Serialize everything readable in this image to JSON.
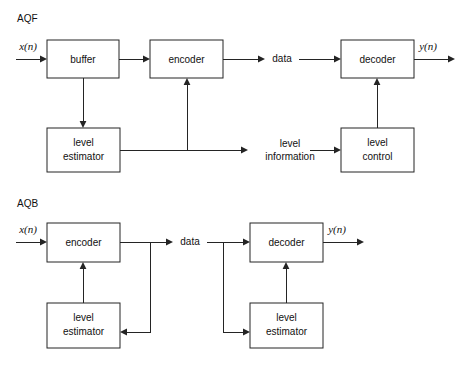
{
  "figure": {
    "width": 466,
    "height": 367,
    "background": "#ffffff",
    "line_color": "#242424",
    "text_color": "#111111"
  },
  "diagrams": [
    {
      "id": "aqf",
      "title": "AQF",
      "title_x": 17,
      "title_y": 19,
      "boxes": [
        {
          "id": "aqf-buffer",
          "label": "buffer",
          "x": 47,
          "y": 40,
          "w": 72,
          "h": 38
        },
        {
          "id": "aqf-encoder",
          "label": "encoder",
          "x": 150,
          "y": 40,
          "w": 73,
          "h": 38
        },
        {
          "id": "aqf-decoder",
          "label": "decoder",
          "x": 341,
          "y": 40,
          "w": 73,
          "h": 38
        },
        {
          "id": "aqf-level-estimator",
          "label": "level\nestimator",
          "x": 47,
          "y": 128,
          "w": 73,
          "h": 44
        },
        {
          "id": "aqf-level-control",
          "label": "level\ncontrol",
          "x": 341,
          "y": 128,
          "w": 73,
          "h": 44
        }
      ],
      "labels": [
        {
          "id": "aqf-input-signal",
          "text": "x(n)",
          "x": 28,
          "y": 48,
          "kind": "signal"
        },
        {
          "id": "aqf-output-signal",
          "text": "y(n)",
          "x": 428,
          "y": 48,
          "kind": "signal"
        },
        {
          "id": "aqf-data",
          "text": "data",
          "x": 282,
          "y": 59,
          "kind": "wire"
        },
        {
          "id": "aqf-level-information-line1",
          "text": "level",
          "x": 290,
          "y": 144,
          "kind": "wire"
        },
        {
          "id": "aqf-level-information-line2",
          "text": "information",
          "x": 290,
          "y": 157,
          "kind": "wire"
        }
      ]
    },
    {
      "id": "aqb",
      "title": "AQB",
      "title_x": 17,
      "title_y": 204,
      "boxes": [
        {
          "id": "aqb-encoder",
          "label": "encoder",
          "x": 47,
          "y": 223,
          "w": 73,
          "h": 39
        },
        {
          "id": "aqb-decoder",
          "label": "decoder",
          "x": 250,
          "y": 223,
          "w": 73,
          "h": 39
        },
        {
          "id": "aqb-level-estimator-left",
          "label": "level\nestimator",
          "x": 47,
          "y": 303,
          "w": 73,
          "h": 45
        },
        {
          "id": "aqb-level-estimator-right",
          "label": "level\nestimator",
          "x": 250,
          "y": 303,
          "w": 73,
          "h": 45
        }
      ],
      "labels": [
        {
          "id": "aqb-input-signal",
          "text": "x(n)",
          "x": 28,
          "y": 231,
          "kind": "signal"
        },
        {
          "id": "aqb-output-signal",
          "text": "y(n)",
          "x": 337,
          "y": 231,
          "kind": "signal"
        },
        {
          "id": "aqb-data",
          "text": "data",
          "x": 190,
          "y": 242,
          "kind": "wire"
        }
      ]
    }
  ],
  "connections": {
    "aqf": [
      "input arrow into buffer",
      "buffer to encoder",
      "encoder to data",
      "data to decoder",
      "decoder to output",
      "buffer down to level estimator",
      "level estimator right to level information",
      "level estimator branch up into encoder",
      "level information to level control",
      "level control up into decoder"
    ],
    "aqb": [
      "input arrow into encoder",
      "encoder to data",
      "data to decoder",
      "decoder to output",
      "encoder output branch down to left level estimator",
      "left level estimator up into encoder",
      "data branch down to right level estimator",
      "right level estimator up into decoder"
    ]
  }
}
